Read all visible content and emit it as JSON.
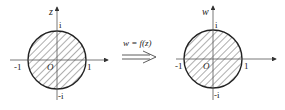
{
  "diagram": {
    "type": "conformal-mapping",
    "colors": {
      "stroke": "#222222",
      "hatch": "#333333",
      "axis": "#555555",
      "background": "#ffffff"
    },
    "left_plane": {
      "variable_label": "z",
      "origin_label": "O",
      "tick_labels": {
        "pos_real": "1",
        "neg_real": "-1",
        "pos_imag": "i",
        "neg_imag": "-i"
      },
      "region": "shaded unit disk |z| < 1"
    },
    "mapping": {
      "label": "w = f(z)",
      "arrow": "double-line right arrow"
    },
    "right_plane": {
      "variable_label": "w",
      "origin_label": "O",
      "tick_labels": {
        "pos_real": "1",
        "neg_real": "-1",
        "pos_imag": "i",
        "neg_imag": "-i"
      },
      "region": "shaded unit disk |w| < 1"
    }
  }
}
